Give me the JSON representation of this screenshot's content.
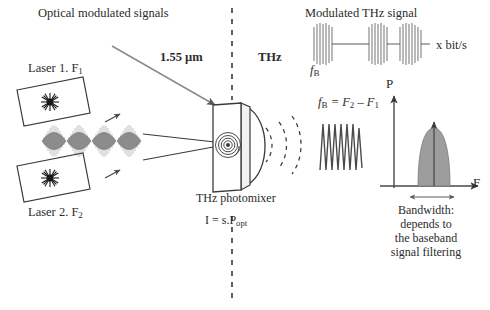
{
  "figure": {
    "title_text": "Photomixing THz transmitter block diagram",
    "ink_color": "#3a3a3a",
    "wave_fill": "#8a8a8a",
    "spectrum_fill": "#9a9a9a"
  },
  "labels": {
    "optical_modulated_signals": "Optical modulated signals",
    "laser1": "Laser 1. F",
    "laser1_sub": "1",
    "laser2": "Laser 2. F",
    "laser2_sub": "2",
    "wavelength": "1.55 µm",
    "thz": "THz",
    "photomixer": "THz photomixer",
    "responsivity_pre": "I = s.P",
    "responsivity_sub": "opt",
    "modulated_thz_signal": "Modulated THz signal",
    "bitrate": "x bit/s",
    "fb_under_burst": "f",
    "fb_under_burst_sub": "B",
    "beat_eq_fb": "f",
    "beat_eq_fb_sub": "B",
    "beat_eq_rest": " = F",
    "beat_eq_sub2": "2",
    "beat_eq_minus": " – F",
    "beat_eq_sub1": "1",
    "axis_p": "P",
    "axis_f": "F",
    "bandwidth_line1": "Bandwidth:",
    "bandwidth_line2": "depends to",
    "bandwidth_line3": "the baseband",
    "bandwidth_line4": "signal filtering"
  },
  "diagram": {
    "beat_envelopes": 4,
    "thz_arcs": 3,
    "modulation_bursts": 3,
    "baseband_sine_cycles": 6,
    "dashed_divider_x": 232
  }
}
